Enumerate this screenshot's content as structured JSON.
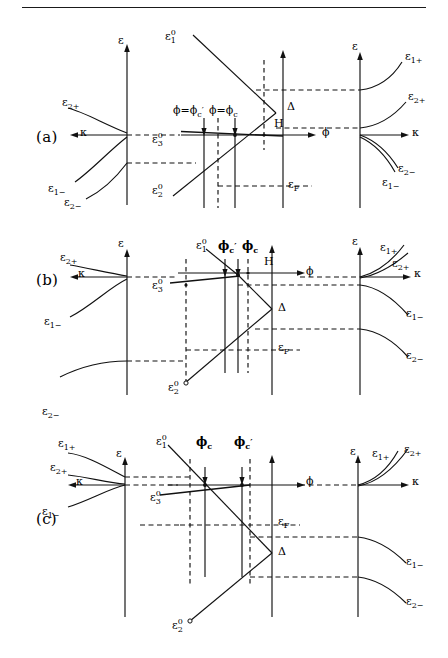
{
  "figure": {
    "panels": [
      {
        "id": "a",
        "label": "(a)",
        "left_plot": {
          "vertical_axis_label": "ε",
          "horizontal_axis_label": "κ",
          "curves": [
            "ε",
            "ε",
            "ε"
          ],
          "curve_labels": [
            "ε₂₊",
            "ε₁₋",
            "ε₂₋"
          ]
        },
        "center_plot": {
          "vertical_axis_label": "ε",
          "horizontal_axis_label": "ϕ",
          "field_marker": "H",
          "gap_label": "Δ",
          "fermi_label": "ε_F",
          "branch_upper": "ε₁⁰",
          "branch_lower": "ε₂⁰",
          "level_flat": "ε₃⁰",
          "critical_1": "ϕ=ϕᴄ′",
          "critical_2": "ϕ=ϕᴄ"
        },
        "right_plot": {
          "vertical_axis_label": "ε",
          "horizontal_axis_label": "κ",
          "curve_labels": [
            "ε₁₊",
            "ε₂₊",
            "ε₂₋",
            "ε₁₋"
          ]
        }
      },
      {
        "id": "b",
        "label": "(b)",
        "left_plot": {
          "vertical_axis_label": "ε",
          "horizontal_axis_label": "κ",
          "curve_labels": [
            "ε₂₊",
            "ε₁₋",
            "ε₂₋"
          ]
        },
        "center_plot": {
          "vertical_axis_label": "ε",
          "horizontal_axis_label": "ϕ",
          "field_marker": "H",
          "gap_label": "Δ",
          "fermi_label": "ε_F",
          "branch_upper": "ε₁⁰",
          "branch_lower": "ε₂⁰",
          "level_flat": "ε₃⁰",
          "critical_1": "ϕᴄ′",
          "critical_2": "ϕᴄ"
        },
        "right_plot": {
          "vertical_axis_label": "ε",
          "horizontal_axis_label": "κ",
          "curve_labels": [
            "ε₁₊",
            "ε₂₊",
            "ε₁₋",
            "ε₂₋"
          ]
        }
      },
      {
        "id": "c",
        "label": "(c)",
        "left_plot": {
          "vertical_axis_label": "ε",
          "horizontal_axis_label": "κ",
          "curve_labels": [
            "ε₁₊",
            "ε₂₊",
            "ε₁₋"
          ]
        },
        "center_plot": {
          "vertical_axis_label": "ε",
          "horizontal_axis_label": "ϕ",
          "gap_label": "Δ",
          "fermi_label": "ε_F",
          "branch_upper": "ε₁⁰",
          "branch_lower": "ε₂⁰",
          "level_flat": "ε₃⁰",
          "critical_1": "ϕᴄ",
          "critical_2": "ϕᴄ′"
        },
        "right_plot": {
          "vertical_axis_label": "ε",
          "horizontal_axis_label": "κ",
          "curve_labels": [
            "ε₁₊",
            "ε₂₊",
            "ε₁₋",
            "ε₂₋"
          ]
        }
      }
    ],
    "symbols": {
      "epsilon": "ε",
      "kappa": "κ",
      "phi": "ϕ",
      "delta": "Δ",
      "prime": "′",
      "sub_F": "F",
      "sub_c": "c",
      "sub_1": "1",
      "sub_2": "2",
      "sub_3": "3",
      "sup_0": "0",
      "plus": "+",
      "minus": "−",
      "field_H": "H"
    },
    "style": {
      "line_color": "#111111",
      "dash_color": "#111111",
      "background": "#ffffff",
      "rule_color": "#1a1a1a"
    }
  }
}
